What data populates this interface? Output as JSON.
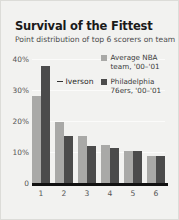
{
  "title": "Survival of the Fittest",
  "subtitle": "Point distribution of top 6 scorers on team",
  "annotation": {
    "label": "Iverson"
  },
  "legend": [
    {
      "label": "Average NBA team, '00–'01",
      "color": "#a9a9a7",
      "swatch_name": "legend-swatch-average-nba"
    },
    {
      "label": "Philadelphia 76ers, '00–'01",
      "color": "#4b4b4b",
      "swatch_name": "legend-swatch-philadelphia"
    }
  ],
  "yticks": [
    "40%",
    "30%",
    "20%",
    "10%",
    "0"
  ],
  "chart_data": {
    "type": "bar",
    "title": "Survival of the Fittest",
    "subtitle": "Point distribution of top 6 scorers on team",
    "xlabel": "",
    "ylabel": "",
    "categories": [
      "1",
      "2",
      "3",
      "4",
      "5",
      "6"
    ],
    "series": [
      {
        "name": "Average NBA team, '00–'01",
        "color": "#a9a9a7",
        "values": [
          29.5,
          20.8,
          16.0,
          12.8,
          10.8,
          9.2
        ]
      },
      {
        "name": "Philadelphia 76ers, '00–'01",
        "color": "#4b4b4b",
        "values": [
          39.8,
          16.0,
          12.7,
          11.9,
          10.8,
          9.2
        ]
      }
    ],
    "ylim": [
      0,
      42
    ],
    "yticks": [
      0,
      10,
      20,
      30,
      40
    ],
    "ytick_labels": [
      "0",
      "10%",
      "20%",
      "30%",
      "40%"
    ],
    "grid": true,
    "legend_position": "upper right",
    "annotations": [
      {
        "text": "Iverson",
        "points_to": {
          "series": "Philadelphia 76ers, '00–'01",
          "category": "1",
          "value": 39.8
        }
      }
    ]
  }
}
